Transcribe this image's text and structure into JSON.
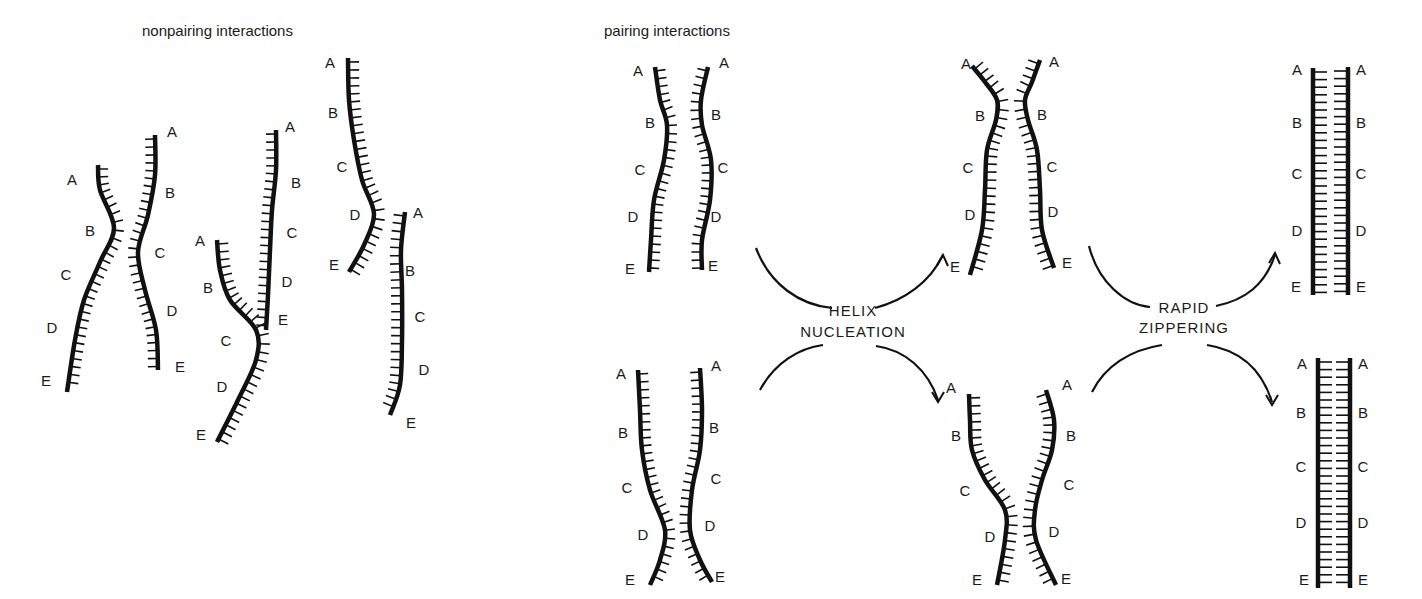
{
  "panels": {
    "nonpairing": {
      "title": "nonpairing interactions"
    },
    "pairing": {
      "title": "pairing interactions"
    }
  },
  "steps": {
    "nucleation": {
      "line1": "HELIX",
      "line2": "NUCLEATION"
    },
    "zippering": {
      "line1": "RAPID",
      "line2": "ZIPPERING"
    }
  },
  "segment_labels": [
    "A",
    "B",
    "C",
    "D",
    "E"
  ],
  "colors": {
    "strand": "#111111",
    "background": "#ffffff"
  },
  "strands": [
    {
      "id": "np1",
      "points": [
        [
          98,
          165
        ],
        [
          100,
          190
        ],
        [
          114,
          228
        ],
        [
          100,
          262
        ],
        [
          84,
          300
        ],
        [
          75,
          340
        ],
        [
          67,
          392
        ]
      ],
      "side": 1,
      "tick": 10,
      "labels": [
        [
          72,
          185
        ],
        [
          90,
          236
        ],
        [
          66,
          280
        ],
        [
          52,
          333
        ],
        [
          46,
          386
        ]
      ]
    },
    {
      "id": "np2",
      "points": [
        [
          155,
          135
        ],
        [
          155,
          175
        ],
        [
          148,
          215
        ],
        [
          138,
          252
        ],
        [
          145,
          290
        ],
        [
          156,
          330
        ],
        [
          158,
          370
        ]
      ],
      "side": -1,
      "tick": 10,
      "labels": [
        [
          172,
          137
        ],
        [
          170,
          198
        ],
        [
          160,
          258
        ],
        [
          172,
          316
        ],
        [
          180,
          372
        ]
      ]
    },
    {
      "id": "np3",
      "points": [
        [
          217,
          240
        ],
        [
          220,
          270
        ],
        [
          230,
          300
        ],
        [
          256,
          330
        ],
        [
          256,
          360
        ],
        [
          238,
          400
        ],
        [
          217,
          442
        ]
      ],
      "side": 1,
      "tick": 11,
      "labels": [
        [
          200,
          246
        ],
        [
          208,
          293
        ],
        [
          226,
          346
        ],
        [
          222,
          392
        ],
        [
          201,
          440
        ]
      ]
    },
    {
      "id": "np4",
      "points": [
        [
          276,
          130
        ],
        [
          276,
          170
        ],
        [
          272,
          210
        ],
        [
          270,
          250
        ],
        [
          268,
          295
        ],
        [
          266,
          330
        ]
      ],
      "side": -1,
      "tick": 10,
      "labels": [
        [
          290,
          132
        ],
        [
          296,
          188
        ],
        [
          292,
          238
        ],
        [
          287,
          287
        ],
        [
          283,
          325
        ]
      ]
    },
    {
      "id": "np5",
      "points": [
        [
          348,
          58
        ],
        [
          349,
          100
        ],
        [
          354,
          140
        ],
        [
          362,
          180
        ],
        [
          374,
          214
        ],
        [
          364,
          245
        ],
        [
          349,
          272
        ]
      ],
      "side": 1,
      "tick": 11,
      "labels": [
        [
          330,
          68
        ],
        [
          333,
          118
        ],
        [
          342,
          172
        ],
        [
          355,
          220
        ],
        [
          334,
          270
        ]
      ]
    },
    {
      "id": "np6",
      "points": [
        [
          405,
          212
        ],
        [
          401,
          250
        ],
        [
          402,
          290
        ],
        [
          402,
          340
        ],
        [
          400,
          385
        ],
        [
          390,
          415
        ]
      ],
      "side": -1,
      "tick": 11,
      "labels": [
        [
          418,
          218
        ],
        [
          410,
          276
        ],
        [
          420,
          322
        ],
        [
          424,
          375
        ],
        [
          411,
          428
        ]
      ]
    },
    {
      "id": "p1a",
      "points": [
        [
          655,
          67
        ],
        [
          660,
          100
        ],
        [
          667,
          125
        ],
        [
          664,
          160
        ],
        [
          654,
          200
        ],
        [
          651,
          240
        ],
        [
          649,
          272
        ]
      ],
      "side": 1,
      "tick": 10,
      "labels": [
        [
          638,
          76
        ],
        [
          650,
          128
        ],
        [
          640,
          175
        ],
        [
          633,
          222
        ],
        [
          630,
          274
        ]
      ]
    },
    {
      "id": "p1b",
      "points": [
        [
          708,
          67
        ],
        [
          701,
          100
        ],
        [
          702,
          125
        ],
        [
          711,
          160
        ],
        [
          710,
          200
        ],
        [
          702,
          240
        ],
        [
          702,
          270
        ]
      ],
      "side": -1,
      "tick": 10,
      "labels": [
        [
          724,
          68
        ],
        [
          716,
          120
        ],
        [
          723,
          173
        ],
        [
          716,
          222
        ],
        [
          713,
          271
        ]
      ]
    },
    {
      "id": "p2a",
      "points": [
        [
          972,
          66
        ],
        [
          985,
          82
        ],
        [
          997,
          100
        ],
        [
          996,
          120
        ],
        [
          987,
          150
        ],
        [
          985,
          190
        ],
        [
          982,
          230
        ],
        [
          970,
          275
        ]
      ],
      "side": 1,
      "tick": 11,
      "labels": [
        [
          966,
          69
        ],
        [
          980,
          121
        ],
        [
          968,
          173
        ],
        [
          970,
          220
        ],
        [
          955,
          272
        ]
      ]
    },
    {
      "id": "p2b",
      "points": [
        [
          1040,
          60
        ],
        [
          1032,
          82
        ],
        [
          1025,
          100
        ],
        [
          1028,
          120
        ],
        [
          1037,
          150
        ],
        [
          1040,
          190
        ],
        [
          1042,
          230
        ],
        [
          1054,
          268
        ]
      ],
      "side": -1,
      "tick": 11,
      "labels": [
        [
          1054,
          67
        ],
        [
          1042,
          120
        ],
        [
          1052,
          172
        ],
        [
          1053,
          217
        ],
        [
          1067,
          268
        ]
      ]
    },
    {
      "id": "p3a",
      "points": [
        [
          1313,
          68
        ],
        [
          1313,
          295
        ]
      ],
      "side": 1,
      "tick": 14,
      "straight": true,
      "labels": [
        [
          1297,
          75
        ],
        [
          1297,
          128
        ],
        [
          1297,
          179
        ],
        [
          1297,
          236
        ],
        [
          1296,
          292
        ]
      ]
    },
    {
      "id": "p3b",
      "points": [
        [
          1348,
          67
        ],
        [
          1348,
          295
        ]
      ],
      "side": -1,
      "tick": 14,
      "straight": true,
      "labels": [
        [
          1361,
          75
        ],
        [
          1361,
          128
        ],
        [
          1361,
          179
        ],
        [
          1361,
          236
        ],
        [
          1361,
          292
        ]
      ]
    },
    {
      "id": "p4a",
      "points": [
        [
          638,
          370
        ],
        [
          640,
          410
        ],
        [
          642,
          450
        ],
        [
          650,
          490
        ],
        [
          665,
          530
        ],
        [
          660,
          560
        ],
        [
          650,
          585
        ]
      ],
      "side": 1,
      "tick": 10,
      "labels": [
        [
          621,
          379
        ],
        [
          623,
          438
        ],
        [
          627,
          493
        ],
        [
          643,
          540
        ],
        [
          630,
          585
        ]
      ]
    },
    {
      "id": "p4b",
      "points": [
        [
          700,
          368
        ],
        [
          702,
          410
        ],
        [
          700,
          450
        ],
        [
          692,
          490
        ],
        [
          690,
          530
        ],
        [
          700,
          560
        ],
        [
          712,
          582
        ]
      ],
      "side": -1,
      "tick": 10,
      "labels": [
        [
          716,
          371
        ],
        [
          714,
          433
        ],
        [
          716,
          484
        ],
        [
          710,
          531
        ],
        [
          720,
          582
        ]
      ]
    },
    {
      "id": "p5a",
      "points": [
        [
          969,
          394
        ],
        [
          970,
          420
        ],
        [
          972,
          450
        ],
        [
          985,
          480
        ],
        [
          1005,
          510
        ],
        [
          1005,
          540
        ],
        [
          997,
          585
        ]
      ],
      "side": 1,
      "tick": 11,
      "labels": [
        [
          951,
          393
        ],
        [
          956,
          441
        ],
        [
          965,
          496
        ],
        [
          990,
          542
        ],
        [
          977,
          585
        ]
      ]
    },
    {
      "id": "p5b",
      "points": [
        [
          1046,
          390
        ],
        [
          1054,
          420
        ],
        [
          1052,
          450
        ],
        [
          1042,
          480
        ],
        [
          1035,
          510
        ],
        [
          1036,
          540
        ],
        [
          1056,
          585
        ]
      ],
      "side": -1,
      "tick": 11,
      "labels": [
        [
          1067,
          390
        ],
        [
          1071,
          441
        ],
        [
          1069,
          490
        ],
        [
          1054,
          537
        ],
        [
          1066,
          584
        ]
      ]
    },
    {
      "id": "p6a",
      "points": [
        [
          1318,
          358
        ],
        [
          1318,
          588
        ]
      ],
      "side": 1,
      "tick": 14,
      "straight": true,
      "labels": [
        [
          1302,
          369
        ],
        [
          1301,
          418
        ],
        [
          1301,
          472
        ],
        [
          1301,
          528
        ],
        [
          1304,
          585
        ]
      ]
    },
    {
      "id": "p6b",
      "points": [
        [
          1350,
          358
        ],
        [
          1350,
          588
        ]
      ],
      "side": -1,
      "tick": 14,
      "straight": true,
      "labels": [
        [
          1363,
          369
        ],
        [
          1363,
          418
        ],
        [
          1363,
          472
        ],
        [
          1363,
          528
        ],
        [
          1363,
          585
        ]
      ]
    }
  ],
  "arrows": [
    {
      "id": "nucleation-up",
      "d": "M756,248 C770,285 800,305 832,308",
      "head": false
    },
    {
      "id": "nucleation-up-right",
      "d": "M875,308 C905,300 930,282 943,255",
      "head": true,
      "hx": 943,
      "hy": 255,
      "dir": "up"
    },
    {
      "id": "nucleation-down-left",
      "d": "M760,390 C775,362 800,348 823,345",
      "head": false
    },
    {
      "id": "nucleation-down-right",
      "d": "M876,346 C905,350 928,370 938,400",
      "head": true,
      "hx": 938,
      "hy": 402,
      "dir": "down"
    },
    {
      "id": "zipper-up-left",
      "d": "M1089,246 C1098,282 1125,305 1150,307",
      "head": false
    },
    {
      "id": "zipper-up-right",
      "d": "M1216,306 C1245,300 1265,285 1275,255",
      "head": true,
      "hx": 1275,
      "hy": 253,
      "dir": "up"
    },
    {
      "id": "zipper-down-left",
      "d": "M1092,392 C1105,366 1130,350 1162,345",
      "head": false
    },
    {
      "id": "zipper-down-right",
      "d": "M1207,345 C1240,350 1262,370 1272,402",
      "head": true,
      "hx": 1272,
      "hy": 405,
      "dir": "down"
    }
  ]
}
